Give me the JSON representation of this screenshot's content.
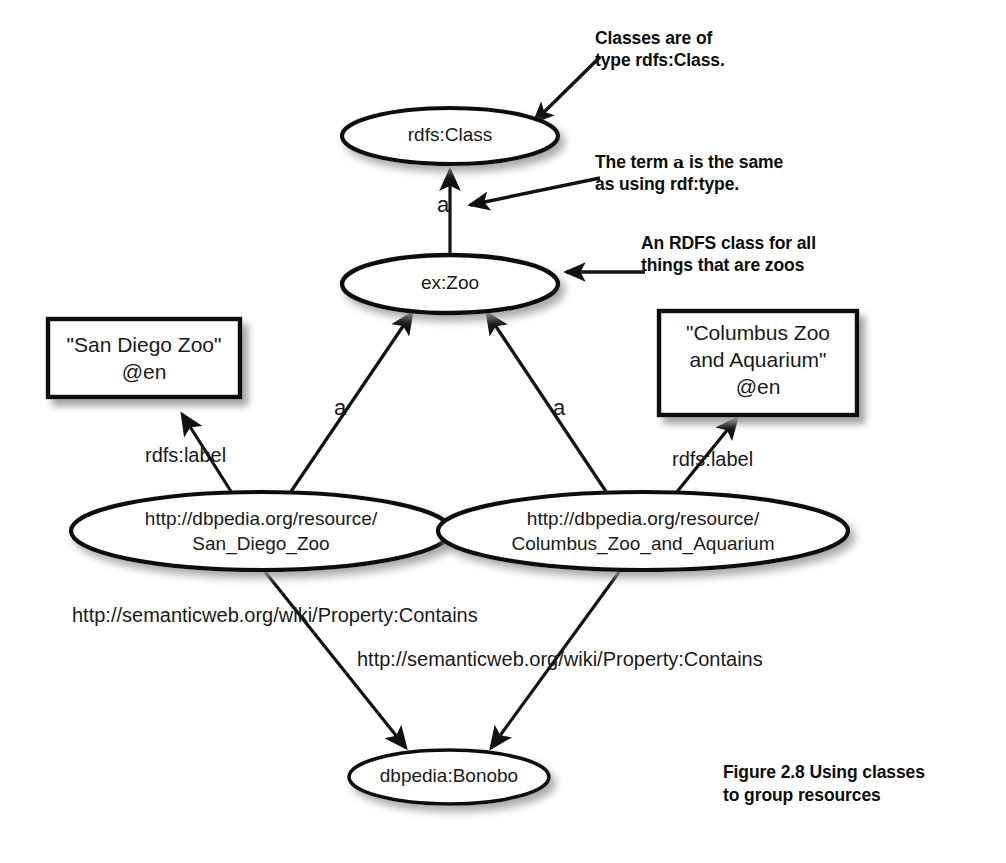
{
  "figure": {
    "caption_line1": "Figure 2.8   Using classes",
    "caption_line2": "to group resources"
  },
  "nodes": {
    "rdfs_class": {
      "label": "rdfs:Class",
      "shape": "ellipse"
    },
    "ex_zoo": {
      "label": "ex:Zoo",
      "shape": "ellipse"
    },
    "san_diego_resource_line1": "http://dbpedia.org/resource/",
    "san_diego_resource_line2": "San_Diego_Zoo",
    "columbus_resource_line1": "http://dbpedia.org/resource/",
    "columbus_resource_line2": "Columbus_Zoo_and_Aquarium",
    "bonobo": {
      "label": "dbpedia:Bonobo",
      "shape": "ellipse"
    }
  },
  "literals": {
    "san_diego": {
      "line1": "\"San Diego Zoo\"",
      "line2": "@en"
    },
    "columbus": {
      "line1": "\"Columbus Zoo",
      "line2": "and Aquarium\"",
      "line3": "@en"
    }
  },
  "edges": {
    "zoo_type_class": "a",
    "san_diego_type_zoo": "a",
    "columbus_type_zoo": "a",
    "san_diego_label": "rdfs:label",
    "columbus_label": "rdfs:label",
    "san_diego_contains": "http://semanticweb.org/wiki/Property:Contains",
    "columbus_contains": "http://semanticweb.org/wiki/Property:Contains"
  },
  "annotations": {
    "classes_note": {
      "line1": "Classes are of",
      "line2": "type rdfs:Class."
    },
    "term_a_note": {
      "pre": "The term ",
      "term": "a",
      "post": " is the same",
      "line2": "as using rdf:type."
    },
    "zoo_class_note": {
      "line1": "An RDFS class for all",
      "line2": "things that are zoos"
    }
  },
  "colors": {
    "stroke": "#111111",
    "fill": "#ffffff",
    "text": "#1a1a1a",
    "shadow": "#b8b8b8"
  }
}
